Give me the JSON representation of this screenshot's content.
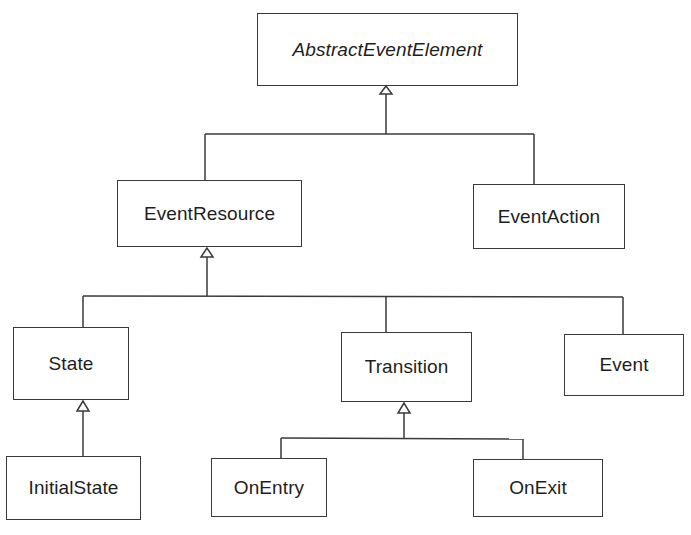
{
  "diagram": {
    "type": "uml-class-hierarchy",
    "relationship": "generalization",
    "colors": {
      "line": "#3a3a3a",
      "text": "#1e1e1e",
      "background": "#ffffff"
    },
    "classes": {
      "abstract_event_element": {
        "name": "AbstractEventElement",
        "abstract": true
      },
      "event_resource": {
        "name": "EventResource",
        "parent": "AbstractEventElement"
      },
      "event_action": {
        "name": "EventAction",
        "parent": "AbstractEventElement"
      },
      "state": {
        "name": "State",
        "parent": "EventResource"
      },
      "transition": {
        "name": "Transition",
        "parent": "EventResource"
      },
      "event": {
        "name": "Event",
        "parent": "EventResource"
      },
      "initial_state": {
        "name": "InitialState",
        "parent": "State"
      },
      "on_entry": {
        "name": "OnEntry",
        "parent": "Transition"
      },
      "on_exit": {
        "name": "OnExit",
        "parent": "Transition"
      }
    }
  }
}
